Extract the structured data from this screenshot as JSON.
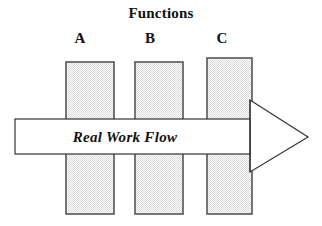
{
  "figure": {
    "title": "Functions",
    "title_center_x": 154,
    "title_y": 5,
    "background": "#ffffff",
    "width": 322,
    "height": 226
  },
  "columns": [
    {
      "label": "A",
      "label_x": 80,
      "label_y": 30,
      "bar_x": 66,
      "bar_y": 62,
      "bar_w": 48,
      "bar_h": 152
    },
    {
      "label": "B",
      "label_x": 150,
      "label_y": 30,
      "bar_x": 135,
      "bar_y": 62,
      "bar_w": 48,
      "bar_h": 152
    },
    {
      "label": "C",
      "label_x": 222,
      "label_y": 30,
      "bar_x": 207,
      "bar_y": 58,
      "bar_w": 45,
      "bar_h": 156
    }
  ],
  "arrow": {
    "label": "Real Work Flow",
    "label_center_x": 125,
    "label_center_y": 137,
    "shaft_x": 15,
    "shaft_y": 119,
    "shaft_x2": 250,
    "shaft_y2": 154,
    "head_base_x": 250,
    "head_top_y": 100,
    "head_bottom_y": 172,
    "tip_x": 308,
    "tip_y": 137
  },
  "style": {
    "bar_fill": "#e8e8e8",
    "bar_stipple": "#ffffff",
    "bar_stroke": "#555555",
    "arrow_fill": "#ffffff",
    "arrow_stroke": "#333333",
    "text_color": "#111111"
  }
}
